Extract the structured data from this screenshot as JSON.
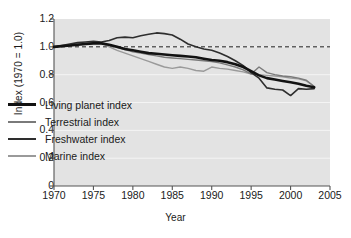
{
  "chart_data": {
    "type": "line",
    "title": "",
    "xlabel": "Year",
    "ylabel": "Index (1970 = 1.0)",
    "xlim": [
      1970,
      2005
    ],
    "ylim": [
      0,
      1.2
    ],
    "grid": true,
    "legend_position": "inside-lower-left",
    "xticks": [
      "1970",
      "1975",
      "1980",
      "1985",
      "1990",
      "1995",
      "2000",
      "2005"
    ],
    "xtick_values": [
      1970,
      1975,
      1980,
      1985,
      1990,
      1995,
      2000,
      2005
    ],
    "yticks": [
      "0",
      "0.2",
      "0.4",
      "0.6",
      "0.8",
      "1.0",
      "1.2"
    ],
    "ytick_values": [
      0,
      0.2,
      0.4,
      0.6,
      0.8,
      1.0,
      1.2
    ],
    "reference_line": {
      "value": 1.0,
      "style": "dashed",
      "color": "#1a1a1a"
    },
    "x": [
      1970,
      1971,
      1972,
      1973,
      1974,
      1975,
      1976,
      1977,
      1978,
      1979,
      1980,
      1981,
      1982,
      1983,
      1984,
      1985,
      1986,
      1987,
      1988,
      1989,
      1990,
      1991,
      1992,
      1993,
      1994,
      1995,
      1996,
      1997,
      1998,
      1999,
      2000,
      2001,
      2002,
      2003
    ],
    "series": [
      {
        "name": "Living planet index",
        "color": "#121212",
        "width": 2.6,
        "values": [
          1.0,
          1.005,
          1.01,
          1.015,
          1.02,
          1.025,
          1.025,
          1.015,
          1.0,
          0.985,
          0.975,
          0.965,
          0.955,
          0.95,
          0.945,
          0.94,
          0.935,
          0.93,
          0.925,
          0.915,
          0.905,
          0.9,
          0.89,
          0.875,
          0.855,
          0.825,
          0.795,
          0.775,
          0.765,
          0.755,
          0.745,
          0.735,
          0.72,
          0.71
        ]
      },
      {
        "name": "Terrestrial index",
        "color": "#7a7a7a",
        "width": 1.4,
        "values": [
          1.0,
          1.005,
          1.01,
          1.015,
          1.025,
          1.03,
          1.025,
          1.01,
          0.995,
          0.98,
          0.965,
          0.955,
          0.945,
          0.935,
          0.925,
          0.92,
          0.915,
          0.91,
          0.905,
          0.9,
          0.895,
          0.885,
          0.87,
          0.855,
          0.835,
          0.805,
          0.855,
          0.815,
          0.8,
          0.79,
          0.785,
          0.775,
          0.76,
          0.715
        ]
      },
      {
        "name": "Freshwater index",
        "color": "#2e2e2e",
        "width": 1.6,
        "values": [
          1.0,
          1.01,
          1.02,
          1.03,
          1.035,
          1.04,
          1.035,
          1.045,
          1.065,
          1.07,
          1.065,
          1.08,
          1.09,
          1.1,
          1.095,
          1.085,
          1.055,
          1.02,
          1.0,
          0.985,
          0.975,
          0.955,
          0.93,
          0.9,
          0.865,
          0.815,
          0.775,
          0.705,
          0.695,
          0.69,
          0.65,
          0.7,
          0.695,
          0.7
        ]
      },
      {
        "name": "Marine index",
        "color": "#9a9a9a",
        "width": 1.4,
        "values": [
          1.0,
          1.005,
          1.01,
          1.02,
          1.025,
          1.03,
          1.025,
          1.0,
          0.975,
          0.955,
          0.935,
          0.915,
          0.895,
          0.875,
          0.855,
          0.845,
          0.855,
          0.845,
          0.83,
          0.825,
          0.855,
          0.845,
          0.84,
          0.83,
          0.82,
          0.805,
          0.8,
          0.795,
          0.79,
          0.785,
          0.775,
          0.77,
          0.755,
          0.715
        ]
      }
    ]
  }
}
